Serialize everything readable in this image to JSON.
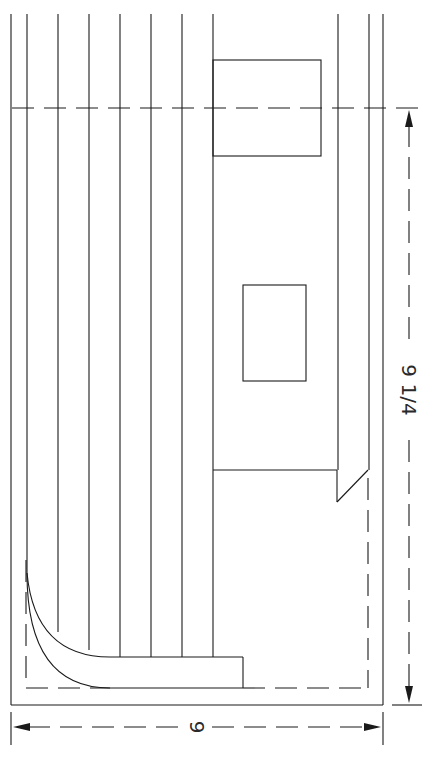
{
  "drawing": {
    "type": "technical-cad-drawing",
    "line_color": "#1a1a1a",
    "background": "#ffffff",
    "dimensions": {
      "vertical": {
        "label": "9 1/4",
        "from_y": 108,
        "to_y": 705,
        "x": 409
      },
      "horizontal": {
        "label": "9",
        "from_x": 11,
        "to_x": 383,
        "y": 727
      }
    },
    "vertical_lines_x": [
      12,
      27,
      59,
      90,
      121,
      152,
      182
    ],
    "boxes": [
      {
        "name": "upper-box",
        "x": 213,
        "y": 60,
        "w": 108,
        "h": 96
      },
      {
        "name": "middle-box",
        "x": 243,
        "y": 285,
        "w": 63,
        "h": 96
      }
    ]
  }
}
